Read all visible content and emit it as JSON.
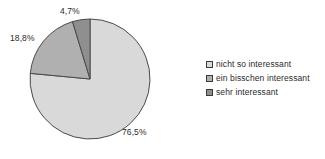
{
  "chart_data": {
    "type": "pie",
    "title": "",
    "subtitle": "",
    "xlabel": "",
    "ylabel": "",
    "grid": false,
    "legend_position": "right",
    "categories": [
      "nicht so interessant",
      "ein bisschen interessant",
      "sehr interessant"
    ],
    "values": [
      76.5,
      18.8,
      4.7
    ],
    "value_labels": [
      "76,5%",
      "18,8%",
      "4,7%"
    ],
    "colors": [
      "#d9d9d9",
      "#b0b0b0",
      "#8f8f8f"
    ],
    "outline_color": "#4a4a4a",
    "background_color": "#ffffff",
    "start_angle_deg": 0,
    "direction": "clockwise",
    "annotations": []
  },
  "legend": {
    "items": [
      {
        "label": "nicht so interessant",
        "color": "#d9d9d9"
      },
      {
        "label": "ein bisschen interessant",
        "color": "#b0b0b0"
      },
      {
        "label": "sehr interessant",
        "color": "#8f8f8f"
      }
    ]
  },
  "labels": {
    "slice_0": "76,5%",
    "slice_1": "18,8%",
    "slice_2": "4,7%"
  }
}
